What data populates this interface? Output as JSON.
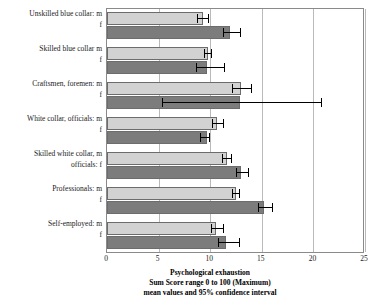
{
  "chart_data": {
    "type": "bar",
    "orientation": "horizontal",
    "title": "Psychological exhaustion",
    "subtitle": "Sum Score range 0 to 100 (Maximum)",
    "subtitle2": "mean values and 95% confidence interval",
    "xlabel": "",
    "ylabel": "",
    "xlim": [
      0,
      25
    ],
    "xticks": [
      0,
      5,
      10,
      15,
      20,
      25
    ],
    "xtick_labels": [
      "0",
      "5",
      "10",
      "15",
      "20",
      "25"
    ],
    "grid": "vertical",
    "legend": "none",
    "categories": [
      "Unskilled blue collar:",
      "Skilled blue collar",
      "Craftsmen, foremen:",
      "White collar, officials:",
      "Skilled white collar,\nofficials:",
      "Professionals:",
      "Self-employed:"
    ],
    "series": [
      {
        "name": "m",
        "color": "#d2d2d2",
        "values": [
          9.3,
          9.8,
          13.0,
          10.7,
          11.6,
          12.5,
          10.6
        ],
        "ci_low": [
          8.7,
          9.4,
          12.1,
          10.2,
          11.1,
          12.1,
          10.1
        ],
        "ci_high": [
          9.9,
          10.2,
          14.1,
          11.3,
          12.1,
          12.9,
          11.3
        ]
      },
      {
        "name": "f",
        "color": "#7c7c7c",
        "values": [
          11.9,
          9.7,
          12.9,
          9.7,
          13.0,
          15.2,
          11.5
        ],
        "ci_low": [
          11.2,
          8.6,
          5.3,
          9.0,
          12.5,
          14.6,
          10.8
        ],
        "ci_high": [
          13.0,
          11.4,
          20.8,
          10.0,
          13.8,
          16.1,
          12.9
        ]
      }
    ],
    "groups": [
      {
        "label_m": "Unskilled blue collar:  m",
        "label_f": "f",
        "label_m2": "",
        "male": {
          "value": 9.3,
          "ci_low": 8.7,
          "ci_high": 9.9
        },
        "female": {
          "value": 11.9,
          "ci_low": 11.2,
          "ci_high": 13.0
        }
      },
      {
        "label_m": "Skilled blue collar  m",
        "label_f": "f",
        "label_m2": "",
        "male": {
          "value": 9.8,
          "ci_low": 9.4,
          "ci_high": 10.2
        },
        "female": {
          "value": 9.7,
          "ci_low": 8.6,
          "ci_high": 11.4
        }
      },
      {
        "label_m": "Craftsmen, foremen:  m",
        "label_f": "f",
        "label_m2": "",
        "male": {
          "value": 13.0,
          "ci_low": 12.1,
          "ci_high": 14.1
        },
        "female": {
          "value": 12.9,
          "ci_low": 5.3,
          "ci_high": 20.8
        }
      },
      {
        "label_m": "White collar, officials:  m",
        "label_f": "f",
        "label_m2": "",
        "male": {
          "value": 10.7,
          "ci_low": 10.2,
          "ci_high": 11.3
        },
        "female": {
          "value": 9.7,
          "ci_low": 9.0,
          "ci_high": 10.0
        }
      },
      {
        "label_m": "Skilled white collar,  m",
        "label_f": "officials:  f",
        "label_m2": "",
        "male": {
          "value": 11.6,
          "ci_low": 11.1,
          "ci_high": 12.1
        },
        "female": {
          "value": 13.0,
          "ci_low": 12.5,
          "ci_high": 13.8
        }
      },
      {
        "label_m": "Professionals:  m",
        "label_f": "f",
        "label_m2": "",
        "male": {
          "value": 12.5,
          "ci_low": 12.1,
          "ci_high": 12.9
        },
        "female": {
          "value": 15.2,
          "ci_low": 14.6,
          "ci_high": 16.1
        }
      },
      {
        "label_m": "Self-employed:  m",
        "label_f": "f",
        "label_m2": "",
        "male": {
          "value": 10.6,
          "ci_low": 10.1,
          "ci_high": 11.3
        },
        "female": {
          "value": 11.5,
          "ci_low": 10.8,
          "ci_high": 12.9
        }
      }
    ]
  },
  "colors": {
    "male_bar": "#d2d2d2",
    "female_bar": "#7c7c7c",
    "bar_outline": "#6c6c6c",
    "gridline": "#b9b9b9",
    "axis": "#8a8a8a",
    "error_bar": "#000000",
    "text": "#1a1a1a",
    "background": "#ffffff"
  }
}
